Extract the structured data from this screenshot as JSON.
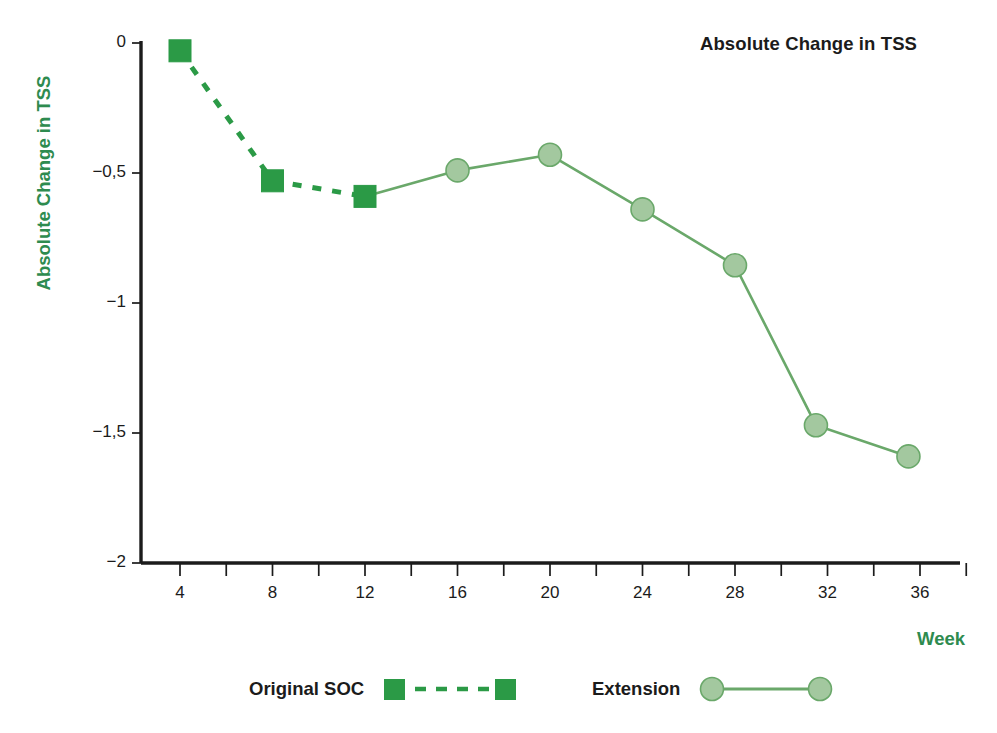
{
  "chart_data": {
    "type": "line",
    "title": "Absolute Change in TSS",
    "xlabel": "Week",
    "ylabel": "Absolute Change in TSS",
    "xlim": [
      2,
      38
    ],
    "ylim": [
      -2,
      0
    ],
    "grid": false,
    "legend_position": "bottom",
    "x_ticks": [
      "4",
      "8",
      "12",
      "16",
      "20",
      "24",
      "28",
      "32",
      "36"
    ],
    "x_tick_values": [
      4,
      8,
      12,
      16,
      20,
      24,
      28,
      32,
      36
    ],
    "y_ticks": [
      "0",
      "−0,5",
      "−1",
      "−1,5",
      "−2"
    ],
    "y_tick_values": [
      0,
      -0.5,
      -1,
      -1.5,
      -2
    ],
    "series": [
      {
        "name": "Original SOC",
        "marker": "square",
        "line_style": "dashed",
        "color": "#2b9a46",
        "marker_fill": "#2b9a46",
        "marker_edge": "#2b9a46",
        "x": [
          4,
          8,
          12
        ],
        "values": [
          -0.03,
          -0.53,
          -0.59
        ]
      },
      {
        "name": "Extension",
        "marker": "circle",
        "line_style": "solid",
        "color": "#6aa86a",
        "marker_fill": "#a3c89f",
        "marker_edge": "#6aa86a",
        "x": [
          16,
          20,
          24,
          28,
          31.5,
          35.5
        ],
        "values": [
          -0.49,
          -0.43,
          -0.64,
          -0.855,
          -1.47,
          -1.59
        ]
      }
    ],
    "connector": {
      "from_series": "Original SOC",
      "from_x": 12,
      "from_value": -0.59,
      "to_series": "Extension",
      "to_x": 16,
      "to_value": -0.49,
      "color": "#6aa86a"
    }
  },
  "legend": {
    "items": [
      {
        "label": "Original SOC",
        "marker": "square",
        "style": "dashed",
        "color": "#2b9a46"
      },
      {
        "label": "Extension",
        "marker": "circle",
        "style": "solid",
        "color": "#6aa86a"
      }
    ]
  },
  "colors": {
    "accent_green": "#2e8b4f",
    "soc_green": "#2b9a46",
    "extension_line": "#6aa86a",
    "extension_fill": "#a3c89f",
    "axis_black": "#1b1b1b",
    "background": "#ffffff"
  }
}
